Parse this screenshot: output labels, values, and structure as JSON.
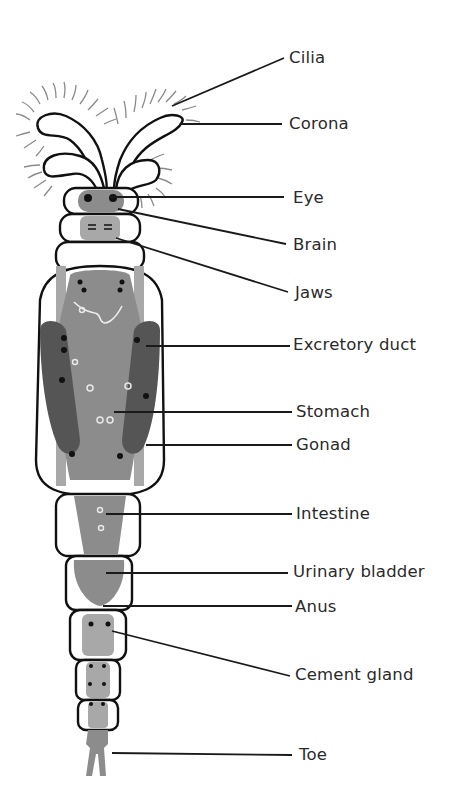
{
  "diagram": {
    "type": "labeled anatomical diagram",
    "colors": {
      "background": "#ffffff",
      "outline": "#111111",
      "organ_gray": "#8c8c8c",
      "dark_gray": "#555555",
      "label_text": "#2a2a2a"
    },
    "labels": [
      {
        "id": "cilia",
        "text": "Cilia"
      },
      {
        "id": "corona",
        "text": "Corona"
      },
      {
        "id": "eye",
        "text": "Eye"
      },
      {
        "id": "brain",
        "text": "Brain"
      },
      {
        "id": "jaws",
        "text": "Jaws"
      },
      {
        "id": "excretory-duct",
        "text": "Excretory duct"
      },
      {
        "id": "stomach",
        "text": "Stomach"
      },
      {
        "id": "gonad",
        "text": "Gonad"
      },
      {
        "id": "intestine",
        "text": "Intestine"
      },
      {
        "id": "urinary-bladder",
        "text": "Urinary bladder"
      },
      {
        "id": "anus",
        "text": "Anus"
      },
      {
        "id": "cement-gland",
        "text": "Cement gland"
      },
      {
        "id": "toe",
        "text": "Toe"
      }
    ]
  }
}
